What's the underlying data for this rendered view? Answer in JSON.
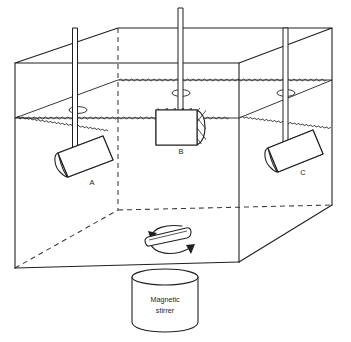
{
  "figure": {
    "background_color": "#ffffff",
    "line_color": "#231f20",
    "hidden_line_color": "#3a3a3a"
  },
  "tank": {
    "name": "transparent rectangular tank",
    "liquid_label": "water surface",
    "front_top_left": [
      15,
      63
    ],
    "front_top_right": [
      239,
      63
    ],
    "back_top_left": [
      118,
      28
    ],
    "back_top_right": [
      332,
      28
    ],
    "front_bottom_left": [
      15,
      268
    ],
    "front_bottom_right": [
      239,
      262
    ],
    "back_bottom_right": [
      332,
      205
    ],
    "back_bottom_left_hidden": [
      118,
      210
    ]
  },
  "baskets": [
    {
      "id": "A",
      "label": "A",
      "label_x": 92,
      "label_y": 183,
      "orientation": "tilted",
      "position": "fully submerged",
      "rod_label": "rod-a"
    },
    {
      "id": "B",
      "label": "B",
      "label_x": 181,
      "label_y": 152,
      "orientation": "horizontal",
      "position": "straddling water surface",
      "rod_label": "rod-b"
    },
    {
      "id": "C",
      "label": "C",
      "label_x": 303,
      "label_y": 173,
      "orientation": "tilted",
      "position": "fully submerged",
      "rod_label": "rod-c"
    }
  ],
  "rods": [
    {
      "id": "rod-a",
      "top_y": 28,
      "bottom_y": 150,
      "x": 75
    },
    {
      "id": "rod-b",
      "top_y": 8,
      "bottom_y": 112,
      "x": 180
    },
    {
      "id": "rod-c",
      "top_y": 28,
      "bottom_y": 140,
      "x": 285
    }
  ],
  "stir_bar": {
    "name": "magnetic stir bar",
    "rotation_indicator": "curved arrows both sides",
    "center_x": 175,
    "center_y": 239
  },
  "stirrer": {
    "name": "magnetic stirrer unit",
    "label_line_1": "Magnetic",
    "label_line_2": "stirrer",
    "center_x": 165,
    "top_y": 277,
    "bottom_y": 330,
    "radius_x": 33,
    "radius_y": 8
  },
  "water_surface": {
    "front_left_y": 118,
    "front_right_y": 118,
    "back_left_y": 80,
    "back_right_y": 80,
    "texture": "wavy zigzag"
  }
}
